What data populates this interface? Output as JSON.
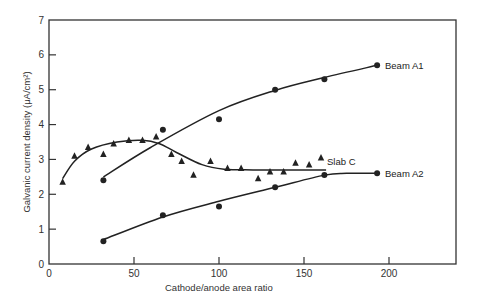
{
  "chart_data": {
    "type": "scatter",
    "title": "",
    "xlabel": "Cathode/anode area ratio",
    "ylabel": "Galvanic current density (μA/cm²)",
    "xlim": [
      0,
      240
    ],
    "ylim": [
      0,
      7
    ],
    "x_ticks": [
      0,
      50,
      100,
      150,
      200
    ],
    "y_ticks": [
      0,
      1,
      2,
      3,
      4,
      5,
      6,
      7
    ],
    "grid": false,
    "legend_position": "inline labels at right end of curves",
    "series": [
      {
        "name": "Beam A1",
        "marker": "circle",
        "points": [
          [
            32,
            2.4
          ],
          [
            67,
            3.85
          ],
          [
            100,
            4.15
          ],
          [
            133,
            5.0
          ],
          [
            162,
            5.3
          ],
          [
            193,
            5.7
          ]
        ],
        "fit_curve": [
          [
            32,
            2.5
          ],
          [
            60,
            3.35
          ],
          [
            100,
            4.4
          ],
          [
            133,
            4.98
          ],
          [
            162,
            5.35
          ],
          [
            193,
            5.7
          ]
        ]
      },
      {
        "name": "Beam A2",
        "marker": "circle",
        "points": [
          [
            32,
            0.65
          ],
          [
            67,
            1.4
          ],
          [
            100,
            1.65
          ],
          [
            133,
            2.2
          ],
          [
            162,
            2.55
          ],
          [
            193,
            2.6
          ]
        ],
        "fit_curve": [
          [
            32,
            0.7
          ],
          [
            67,
            1.35
          ],
          [
            100,
            1.8
          ],
          [
            133,
            2.2
          ],
          [
            162,
            2.55
          ],
          [
            175,
            2.6
          ],
          [
            193,
            2.6
          ]
        ]
      },
      {
        "name": "Slab C",
        "marker": "triangle",
        "points": [
          [
            8,
            2.35
          ],
          [
            15,
            3.1
          ],
          [
            23,
            3.35
          ],
          [
            32,
            3.15
          ],
          [
            38,
            3.45
          ],
          [
            47,
            3.55
          ],
          [
            55,
            3.55
          ],
          [
            63,
            3.65
          ],
          [
            72,
            3.15
          ],
          [
            78,
            2.95
          ],
          [
            85,
            2.55
          ],
          [
            95,
            2.95
          ],
          [
            105,
            2.75
          ],
          [
            113,
            2.75
          ],
          [
            123,
            2.45
          ],
          [
            130,
            2.65
          ],
          [
            138,
            2.65
          ],
          [
            145,
            2.9
          ],
          [
            153,
            2.85
          ],
          [
            160,
            3.05
          ]
        ],
        "fit_curve": [
          [
            8,
            2.45
          ],
          [
            15,
            2.95
          ],
          [
            25,
            3.3
          ],
          [
            40,
            3.5
          ],
          [
            55,
            3.55
          ],
          [
            65,
            3.45
          ],
          [
            75,
            3.2
          ],
          [
            90,
            2.85
          ],
          [
            103,
            2.72
          ],
          [
            120,
            2.7
          ],
          [
            140,
            2.7
          ],
          [
            163,
            2.7
          ]
        ]
      }
    ]
  },
  "labels": {
    "series_a1": "Beam A1",
    "series_a2": "Beam A2",
    "series_c": "Slab C",
    "xlabel": "Cathode/anode area ratio",
    "ylabel": "Galvanic current density (μA/cm²)"
  },
  "colors": {
    "ink": "#222222",
    "axis": "#333333",
    "background": "#ffffff"
  }
}
